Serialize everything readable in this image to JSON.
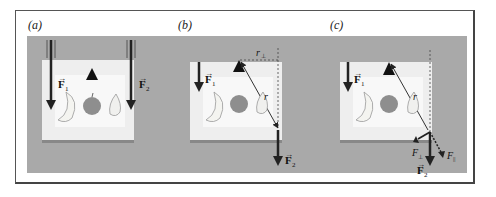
{
  "figure": {
    "panels": [
      {
        "id": "a",
        "label": "(a)",
        "forces": [
          "F1",
          "F2"
        ]
      },
      {
        "id": "b",
        "label": "(b)",
        "forces": [
          "F1",
          "F2"
        ],
        "distances": [
          "r⊥",
          "r"
        ]
      },
      {
        "id": "c",
        "label": "(c)",
        "forces": [
          "F1",
          "F2",
          "F⊥",
          "F∥"
        ],
        "distances": [
          "r"
        ]
      }
    ],
    "labels": {
      "F1": "F",
      "F1_sub": "1",
      "F2": "F",
      "F2_sub": "2",
      "r": "r",
      "r_perp": "r",
      "perp_sub": "⊥",
      "F_perp": "F",
      "F_par": "F",
      "par_sub": "||"
    },
    "colors": {
      "background": "#a9a9a9",
      "board": "#eeeeee",
      "arrow": "#222222"
    }
  }
}
